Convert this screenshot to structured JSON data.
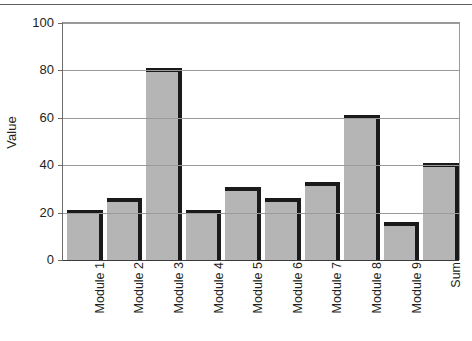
{
  "chart_data": {
    "type": "bar",
    "title": "",
    "xlabel": "",
    "ylabel": "Value",
    "categories": [
      "Module 1",
      "Module 2",
      "Module 3",
      "Module 4",
      "Module 5",
      "Module 6",
      "Module 7",
      "Module 8",
      "Module 9",
      "Sum"
    ],
    "values": [
      21,
      26,
      81,
      21,
      31,
      26,
      33,
      61,
      16,
      41
    ],
    "ylim": [
      0,
      100
    ],
    "yticks": [
      0,
      20,
      40,
      60,
      80,
      100
    ],
    "ytick_labels": [
      "0",
      "20",
      "40",
      "60",
      "80",
      "100"
    ],
    "grid": true,
    "legend": false,
    "legend_position": "none",
    "bar_fill_color": "#b5b5b5",
    "bar_edge_color": "#1a1a1a",
    "gridline_color": "#9a9a9a",
    "axis_color": "#6b6b6b",
    "background_color": "#ffffff",
    "text_color": "#231f20"
  }
}
